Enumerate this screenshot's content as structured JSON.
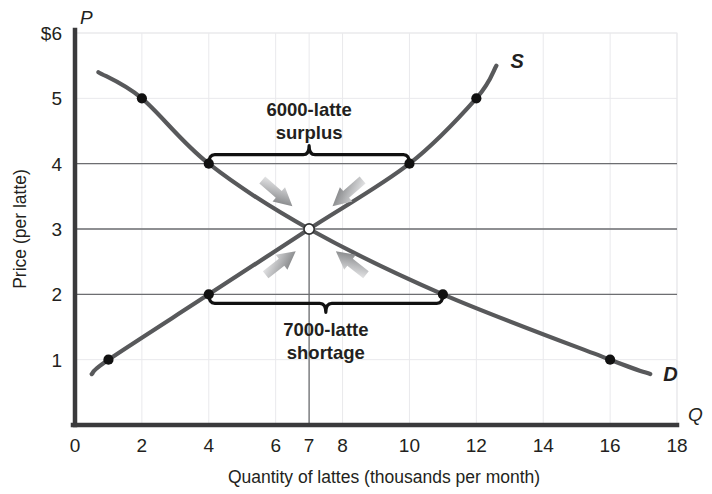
{
  "chart_data": {
    "type": "line",
    "title": "",
    "xlabel": "Quantity of lattes (thousands per month)",
    "ylabel": "Price (per latte)",
    "x_axis_symbol": "Q",
    "y_axis_symbol": "P",
    "xlim": [
      0,
      18
    ],
    "ylim": [
      0,
      6
    ],
    "xticks": [
      0,
      2,
      4,
      6,
      7,
      8,
      10,
      12,
      14,
      16,
      18
    ],
    "xtick_labels": [
      "0",
      "2",
      "4",
      "6",
      "7",
      "8",
      "10",
      "12",
      "14",
      "16",
      "18"
    ],
    "yticks": [
      1,
      2,
      3,
      4,
      5,
      6
    ],
    "ytick_labels": [
      "1",
      "2",
      "3",
      "4",
      "5",
      "$6"
    ],
    "grid": true,
    "legend_position": "curve-end-labels",
    "series": [
      {
        "name": "D",
        "label": "D",
        "type": "demand",
        "color": "#58595b",
        "points": [
          {
            "q": 0.7,
            "p": 5.4
          },
          {
            "q": 2,
            "p": 5
          },
          {
            "q": 4,
            "p": 4
          },
          {
            "q": 7,
            "p": 3
          },
          {
            "q": 11,
            "p": 2
          },
          {
            "q": 16,
            "p": 1
          },
          {
            "q": 17.2,
            "p": 0.78
          }
        ],
        "markers": [
          {
            "q": 2,
            "p": 5
          },
          {
            "q": 4,
            "p": 4
          },
          {
            "q": 11,
            "p": 2
          },
          {
            "q": 16,
            "p": 1
          }
        ]
      },
      {
        "name": "S",
        "label": "S",
        "type": "supply",
        "color": "#58595b",
        "points": [
          {
            "q": 0.5,
            "p": 0.78
          },
          {
            "q": 1,
            "p": 1
          },
          {
            "q": 4,
            "p": 2
          },
          {
            "q": 7,
            "p": 3
          },
          {
            "q": 10,
            "p": 4
          },
          {
            "q": 12,
            "p": 5
          },
          {
            "q": 12.6,
            "p": 5.5
          }
        ],
        "markers": [
          {
            "q": 1,
            "p": 1
          },
          {
            "q": 4,
            "p": 2
          },
          {
            "q": 10,
            "p": 4
          },
          {
            "q": 12,
            "p": 5
          }
        ]
      }
    ],
    "equilibrium": {
      "q": 7,
      "p": 3,
      "marker": "hollow-circle"
    },
    "reference_lines": [
      {
        "type": "horizontal",
        "p": 4,
        "from_q": 0,
        "to_q": 18
      },
      {
        "type": "horizontal",
        "p": 3,
        "from_q": 0,
        "to_q": 18
      },
      {
        "type": "horizontal",
        "p": 2,
        "from_q": 0,
        "to_q": 18
      },
      {
        "type": "vertical",
        "q": 7,
        "from_p": 0,
        "to_p": 3
      }
    ],
    "annotations": [
      {
        "id": "surplus",
        "line1": "6000-latte",
        "line2": "surplus",
        "bracket": {
          "from_q": 4,
          "to_q": 10,
          "at_p": 4,
          "direction": "up"
        }
      },
      {
        "id": "shortage",
        "line1": "7000-latte",
        "line2": "shortage",
        "bracket": {
          "from_q": 4,
          "to_q": 11,
          "at_p": 2,
          "direction": "down"
        }
      }
    ],
    "arrows": [
      {
        "id": "surplus-arrow-left",
        "from_q": 5.6,
        "from_p": 3.75,
        "to_q": 6.5,
        "to_p": 3.35,
        "style": "gradient-gray"
      },
      {
        "id": "surplus-arrow-right",
        "from_q": 8.6,
        "from_p": 3.75,
        "to_q": 7.7,
        "to_p": 3.35,
        "style": "gradient-gray"
      },
      {
        "id": "shortage-arrow-left",
        "from_q": 5.7,
        "from_p": 2.3,
        "to_q": 6.6,
        "to_p": 2.66,
        "style": "gradient-gray"
      },
      {
        "id": "shortage-arrow-right",
        "from_q": 8.7,
        "from_p": 2.3,
        "to_q": 7.8,
        "to_p": 2.66,
        "style": "gradient-gray"
      }
    ],
    "colors": {
      "curve": "#58595b",
      "axis": "#3a3a3c",
      "grid": "#e9e9ec",
      "reference_line": "#6d6e71",
      "marker": "#111111",
      "text": "#231f20",
      "arrow_dark": "#6e7072",
      "arrow_light": "#f2f2f3",
      "background": "#ffffff"
    }
  }
}
